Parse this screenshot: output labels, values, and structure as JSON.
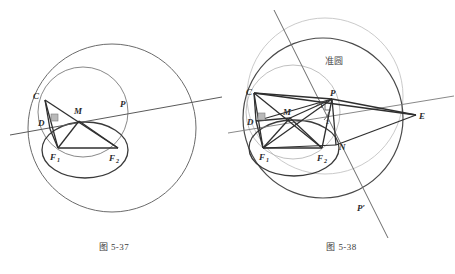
{
  "page": {
    "background": "#ffffff",
    "width": 455,
    "height": 274,
    "stroke_dark": "#3a3a3a",
    "stroke_mid": "#6b6b6b",
    "stroke_light": "#a9a9a9",
    "label_color": "#2b2b2b"
  },
  "figures": [
    {
      "id": "figure-left",
      "caption": "图 5-37",
      "description": "Ellipse with foci F1 and F2, point M on ellipse, tangent line through P, perpendicular foot D, point C; large auxiliary circle and medium circle.",
      "points": [
        {
          "name": "C",
          "label": "C",
          "sub": "",
          "x": 36,
          "y": 96
        },
        {
          "name": "D",
          "label": "D",
          "sub": "",
          "x": 41,
          "y": 122
        },
        {
          "name": "M",
          "label": "M",
          "sub": "",
          "x": 80,
          "y": 111
        },
        {
          "name": "P",
          "label": "P",
          "sub": "",
          "x": 123,
          "y": 104
        },
        {
          "name": "F1",
          "label": "F",
          "sub": "1",
          "x": 54,
          "y": 156
        },
        {
          "name": "F2",
          "label": "F",
          "sub": "2",
          "x": 113,
          "y": 157
        }
      ],
      "markers": [
        {
          "name": "right-angle-at-D",
          "type": "right-angle-square"
        }
      ]
    },
    {
      "id": "figure-right",
      "caption": "图 5-38",
      "description": "Ellipse with foci F1 and F2, director circle labelled 准圆, points C, D, M, P, N, E and extended line through P and P'.",
      "annotation": "准圆",
      "points": [
        {
          "name": "C",
          "label": "C",
          "sub": "",
          "x": 252,
          "y": 92
        },
        {
          "name": "D",
          "label": "D",
          "sub": "",
          "x": 252,
          "y": 121
        },
        {
          "name": "M",
          "label": "M",
          "sub": "",
          "x": 290,
          "y": 112
        },
        {
          "name": "P",
          "label": "P",
          "sub": "",
          "x": 337,
          "y": 100
        },
        {
          "name": "E",
          "label": "E",
          "sub": "",
          "x": 420,
          "y": 116
        },
        {
          "name": "N",
          "label": "N",
          "sub": "",
          "x": 346,
          "y": 146
        },
        {
          "name": "F1",
          "label": "F",
          "sub": "1",
          "x": 264,
          "y": 157
        },
        {
          "name": "F2",
          "label": "F",
          "sub": "2",
          "x": 321,
          "y": 157
        },
        {
          "name": "Pprime",
          "label": "P′",
          "sub": "",
          "x": 360,
          "y": 208
        }
      ],
      "angle_labels": [
        {
          "name": "angle-1",
          "label": "1",
          "x": 326,
          "y": 107
        },
        {
          "name": "angle-2",
          "label": "2",
          "x": 330,
          "y": 127
        }
      ],
      "markers": [
        {
          "name": "right-angle-at-D",
          "type": "right-angle-square"
        }
      ]
    }
  ]
}
